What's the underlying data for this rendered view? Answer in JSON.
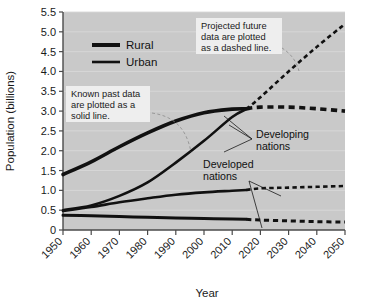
{
  "chart_data": {
    "type": "line",
    "title": "",
    "xlabel": "Year",
    "ylabel": "Population (billions)",
    "xlim": [
      1950,
      2050
    ],
    "ylim": [
      0,
      5.5
    ],
    "grid": true,
    "xticks": [
      "1950",
      "1960",
      "1970",
      "1980",
      "1990",
      "2000",
      "2010",
      "2020",
      "2030",
      "2040",
      "2050"
    ],
    "yticks": [
      "0",
      "0.5",
      "1.0",
      "1.5",
      "2.0",
      "2.5",
      "3.0",
      "3.5",
      "4.0",
      "4.5",
      "5.0",
      "5.5"
    ],
    "legend": {
      "position": "upper-left-inside",
      "entries": [
        {
          "label": "Rural",
          "style": "thick-solid",
          "color": "#111111"
        },
        {
          "label": "Urban",
          "style": "thin-solid",
          "color": "#111111"
        }
      ]
    },
    "series": [
      {
        "name": "Developing nations — Rural",
        "group": "Developing nations",
        "type": "Rural",
        "color": "#111111",
        "width": 3.6,
        "x": [
          1950,
          1960,
          1970,
          1980,
          1990,
          2000,
          2010,
          2015
        ],
        "values": [
          1.4,
          1.72,
          2.1,
          2.45,
          2.75,
          2.96,
          3.05,
          3.06
        ],
        "projected_x": [
          2015,
          2020,
          2030,
          2040,
          2050
        ],
        "projected_values": [
          3.06,
          3.1,
          3.1,
          3.06,
          3.0
        ]
      },
      {
        "name": "Developing nations — Urban",
        "group": "Developing nations",
        "type": "Urban",
        "color": "#111111",
        "width": 2.6,
        "x": [
          1950,
          1960,
          1970,
          1980,
          1990,
          2000,
          2010,
          2015
        ],
        "values": [
          0.5,
          0.62,
          0.86,
          1.2,
          1.7,
          2.25,
          2.85,
          3.05
        ],
        "projected_x": [
          2015,
          2020,
          2030,
          2040,
          2050
        ],
        "projected_values": [
          3.05,
          3.35,
          4.0,
          4.62,
          5.2
        ]
      },
      {
        "name": "Developed nations — Urban",
        "group": "Developed nations",
        "type": "Urban",
        "color": "#111111",
        "width": 2.6,
        "x": [
          1950,
          1960,
          1970,
          1980,
          1990,
          2000,
          2010,
          2015
        ],
        "values": [
          0.48,
          0.58,
          0.7,
          0.8,
          0.89,
          0.95,
          0.99,
          1.01
        ],
        "projected_x": [
          2015,
          2020,
          2030,
          2040,
          2050
        ],
        "projected_values": [
          1.01,
          1.05,
          1.07,
          1.09,
          1.11
        ]
      },
      {
        "name": "Developed nations — Rural",
        "group": "Developed nations",
        "type": "Rural",
        "color": "#111111",
        "width": 3.0,
        "x": [
          1950,
          1960,
          1970,
          1980,
          1990,
          2000,
          2010,
          2015
        ],
        "values": [
          0.37,
          0.36,
          0.34,
          0.32,
          0.3,
          0.29,
          0.275,
          0.27
        ],
        "projected_x": [
          2015,
          2020,
          2030,
          2040,
          2050
        ],
        "projected_values": [
          0.27,
          0.25,
          0.23,
          0.21,
          0.2
        ]
      }
    ],
    "annotations": [
      {
        "name": "known-past-note",
        "text_lines": [
          "Known past data",
          "are plotted as a",
          "solid line."
        ]
      },
      {
        "name": "projected-future-note",
        "text_lines": [
          "Projected future",
          "data are plotted",
          "as a dashed line."
        ]
      },
      {
        "name": "developing-nations-label",
        "text_lines": [
          "Developing",
          "nations"
        ]
      },
      {
        "name": "developed-nations-label",
        "text_lines": [
          "Developed",
          "nations"
        ]
      }
    ],
    "colors": {
      "plot_background": "#c9c9c9",
      "gridline": "#d8d8d8",
      "line": "#111111",
      "axis": "#4a4a4a",
      "callout_background": "#eeeeee",
      "page_background": "#ffffff"
    }
  }
}
